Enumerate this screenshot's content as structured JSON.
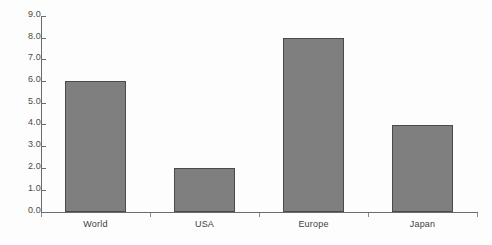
{
  "chart_data": {
    "type": "bar",
    "title": "",
    "subtitle": "",
    "xlabel": "",
    "ylabel": "",
    "categories": [
      "World",
      "USA",
      "Europe",
      "Japan"
    ],
    "values": [
      6.0,
      2.0,
      8.0,
      4.0
    ],
    "ylim": [
      0.0,
      9.0
    ],
    "ytick_labels": [
      "0.0",
      "1.0",
      "2.0",
      "3.0",
      "4.0",
      "5.0",
      "6.0",
      "7.0",
      "8.0",
      "9.0"
    ],
    "ytick_values": [
      0.0,
      1.0,
      2.0,
      3.0,
      4.0,
      5.0,
      6.0,
      7.0,
      8.0,
      9.0
    ],
    "grid": false,
    "legend": null,
    "legend_position": "none",
    "bar_fill_color": "#7f7f7f",
    "bar_border_color": "#4a4a4a",
    "axis_color": "#6b6b6b",
    "background_color": "#fdfdfd",
    "text_color": "#3d3d3d"
  }
}
